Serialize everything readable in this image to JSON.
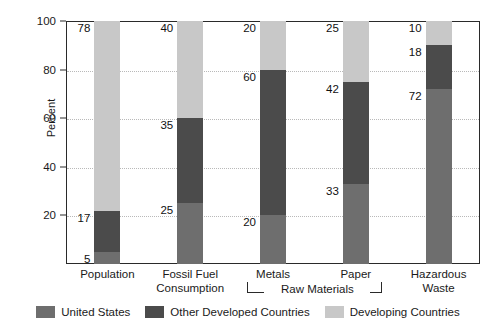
{
  "chart_data": {
    "type": "bar",
    "subtype": "stacked-bar",
    "title": "",
    "xlabel": "",
    "ylabel": "Percent",
    "ylim": [
      0,
      100
    ],
    "yticks": [
      0,
      20,
      40,
      60,
      80,
      100
    ],
    "ytick_labels": [
      "20",
      "40",
      "60",
      "80",
      "100"
    ],
    "ytick_values": [
      20,
      40,
      60,
      80,
      100
    ],
    "grid": "horizontal-dotted",
    "legend_position": "bottom-center",
    "categories": [
      "Population",
      "Fossil Fuel Consumption",
      "Metals",
      "Paper",
      "Hazardous Waste"
    ],
    "category_labels": [
      "Population",
      "Fossil Fuel\nConsumption",
      "Metals",
      "Paper",
      "Hazardous\nWaste"
    ],
    "series": [
      {
        "name": "United States",
        "color": "#6e6e6e",
        "values": [
          5,
          25,
          20,
          33,
          72
        ]
      },
      {
        "name": "Other Developed Countries",
        "color": "#4b4b4b",
        "values": [
          17,
          35,
          60,
          42,
          18
        ]
      },
      {
        "name": "Developing Countries",
        "color": "#c8c8c8",
        "values": [
          78,
          40,
          20,
          25,
          10
        ]
      }
    ],
    "annotations": [
      {
        "text": "Raw Materials",
        "spans": [
          "Metals",
          "Paper"
        ],
        "kind": "group-bracket"
      }
    ]
  },
  "legend": {
    "items": [
      {
        "label": "United States",
        "color": "#6e6e6e"
      },
      {
        "label": "Other Developed Countries",
        "color": "#4b4b4b"
      },
      {
        "label": "Developing Countries",
        "color": "#c8c8c8"
      }
    ]
  },
  "bracket": {
    "label": "Raw Materials"
  }
}
